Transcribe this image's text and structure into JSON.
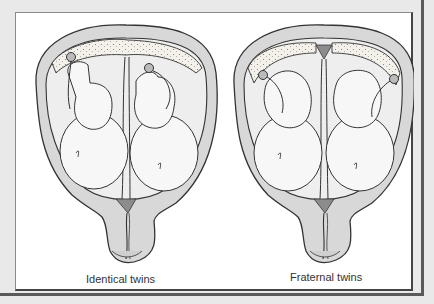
{
  "figure": {
    "panels": [
      {
        "id": "identical",
        "caption": "Identical twins",
        "placenta": "single shared placenta with both umbilical cords",
        "membrane": "thin shared dividing membrane"
      },
      {
        "id": "fraternal",
        "caption": "Fraternal twins",
        "placenta": "two separate placentas at opposite sides",
        "membrane": "thick dividing membrane with dark wedge"
      }
    ],
    "colors": {
      "background": "#e9e9e9",
      "panel": "#ffffff",
      "uterus_wall": "#d8d8d8",
      "fluid": "#eeeeee",
      "placenta": "#f3f1ea",
      "dark_wedge": "#8c8c8c",
      "outline": "#333333"
    }
  }
}
